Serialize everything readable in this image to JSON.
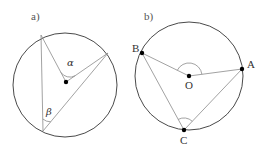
{
  "panels": [
    {
      "id": "a",
      "label": "a)",
      "circle": {
        "cx": 65,
        "cy": 85,
        "r": 52
      },
      "center_point": {
        "x": 66,
        "y": 82
      },
      "points": {
        "top": {
          "x": 41,
          "y": 35
        },
        "right": {
          "x": 108,
          "y": 53
        },
        "bottom": {
          "x": 43,
          "y": 131
        }
      },
      "angles": {
        "alpha": {
          "symbol": "α",
          "description": "central angle at center"
        },
        "beta": {
          "symbol": "β",
          "description": "inscribed angle at bottom vertex"
        }
      }
    },
    {
      "id": "b",
      "label": "b)",
      "circle": {
        "cx": 189,
        "cy": 76,
        "r": 54
      },
      "points": {
        "A": {
          "label": "A",
          "x": 242,
          "y": 69
        },
        "B": {
          "label": "B",
          "x": 142,
          "y": 53
        },
        "C": {
          "label": "C",
          "x": 184,
          "y": 130
        },
        "O": {
          "label": "O",
          "x": 189,
          "y": 76
        }
      }
    }
  ],
  "colors": {
    "circle": "#4a4a4a",
    "lines": "#8a8a8a",
    "points": "#000000",
    "text": "#333333"
  }
}
